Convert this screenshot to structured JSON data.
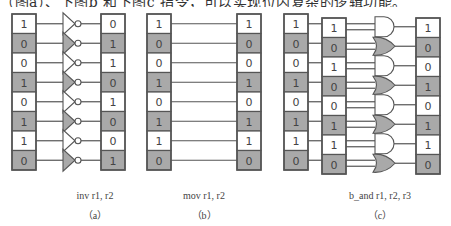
{
  "header_text": "（图a）、下图b 和下图c 指令，可以实现位内复杂的逻辑功能。",
  "colors": {
    "shaded": "#a9a9a9",
    "border": "#555555",
    "wire": "#555555",
    "text": "#444444"
  },
  "panels": [
    {
      "id": "a",
      "instruction": "inv r1, r2",
      "label": "（a）",
      "operation": "inv",
      "source_bits": [
        "1",
        "0",
        "0",
        "1",
        "0",
        "1",
        "1",
        "0"
      ],
      "result_bits": [
        "0",
        "1",
        "1",
        "0",
        "1",
        "0",
        "0",
        "1"
      ],
      "gate": "NOT"
    },
    {
      "id": "b",
      "instruction": "mov r1, r2",
      "label": "（b）",
      "operation": "mov",
      "source_bits": [
        "1",
        "0",
        "0",
        "1",
        "0",
        "1",
        "1",
        "0"
      ],
      "result_bits": [
        "1",
        "0",
        "0",
        "1",
        "0",
        "1",
        "1",
        "0"
      ],
      "gate": "none"
    },
    {
      "id": "c",
      "instruction": "b_and  r1, r2, r3",
      "label": "（c）",
      "operation": "b_and",
      "source_bits": [
        "1",
        "0",
        "0",
        "1",
        "0",
        "1",
        "1",
        "0"
      ],
      "source2_bits": [
        "1",
        "0",
        "1",
        "0",
        "0",
        "1",
        "1",
        "0"
      ],
      "result_bits": [
        "1",
        "0",
        "0",
        "1",
        "0",
        "1",
        "1",
        "0"
      ],
      "gates": [
        "AND",
        "OR",
        "AND",
        "OR",
        "AND",
        "OR",
        "AND",
        "OR"
      ]
    }
  ]
}
